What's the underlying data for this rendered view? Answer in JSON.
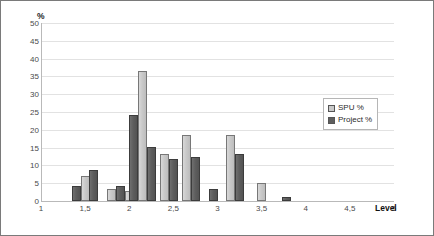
{
  "chart_data": {
    "type": "bar",
    "title": "",
    "xlabel": "Level",
    "ylabel": "%",
    "ylim": [
      0,
      50
    ],
    "ytick_step": 5,
    "yticks": [
      "0",
      "5",
      "10",
      "15",
      "20",
      "25",
      "30",
      "35",
      "40",
      "45",
      "50"
    ],
    "xlim": [
      1,
      5
    ],
    "xticks": [
      "1",
      "1,5",
      "2",
      "2,5",
      "3",
      "3,5",
      "4",
      "4,5",
      "5"
    ],
    "grid": true,
    "legend_position": "right",
    "colors": {
      "spu": "#c9c9c9",
      "project": "#5e5e5e",
      "gridline": "#e2e2e2",
      "axis": "#b9b9b9"
    },
    "series": [
      {
        "name": "SPU %",
        "key": "spu"
      },
      {
        "name": "Project %",
        "key": "project"
      }
    ],
    "x": [
      1.4,
      1.5,
      1.6,
      1.8,
      1.9,
      2.0,
      2.1,
      2.2,
      2.4,
      2.5,
      2.6,
      2.7,
      2.9,
      3.0,
      3.1,
      3.2,
      3.4,
      3.6,
      3.8
    ],
    "bars": [
      {
        "x": 1.4,
        "series": "project",
        "value": 4.3
      },
      {
        "x": 1.5,
        "series": "spu",
        "value": 7.0
      },
      {
        "x": 1.6,
        "series": "project",
        "value": 8.6
      },
      {
        "x": 1.8,
        "series": "spu",
        "value": 3.3
      },
      {
        "x": 1.9,
        "series": "project",
        "value": 4.3
      },
      {
        "x": 2.0,
        "series": "spu",
        "value": 2.8
      },
      {
        "x": 2.05,
        "series": "project",
        "value": 24.3
      },
      {
        "x": 2.15,
        "series": "spu",
        "value": 36.5
      },
      {
        "x": 2.25,
        "series": "project",
        "value": 15.2
      },
      {
        "x": 2.4,
        "series": "spu",
        "value": 13.3
      },
      {
        "x": 2.5,
        "series": "project",
        "value": 11.9
      },
      {
        "x": 2.65,
        "series": "spu",
        "value": 18.6
      },
      {
        "x": 2.75,
        "series": "project",
        "value": 12.4
      },
      {
        "x": 2.95,
        "series": "project",
        "value": 3.3
      },
      {
        "x": 3.15,
        "series": "spu",
        "value": 18.6
      },
      {
        "x": 3.25,
        "series": "project",
        "value": 13.3
      },
      {
        "x": 3.5,
        "series": "spu",
        "value": 5.2
      },
      {
        "x": 3.78,
        "series": "project",
        "value": 1.0
      }
    ]
  },
  "legend": {
    "items": [
      {
        "label": "SPU %",
        "key": "spu"
      },
      {
        "label": "Project %",
        "key": "project"
      }
    ]
  }
}
